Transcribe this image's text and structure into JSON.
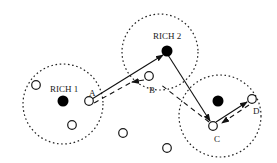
{
  "diagram": {
    "rich_nodes": [
      {
        "id": "rich1",
        "label": "RICH 1"
      },
      {
        "id": "rich2",
        "label": "RICH 2"
      },
      {
        "id": "rich3",
        "label": ""
      }
    ],
    "path_nodes": [
      {
        "id": "A",
        "label": "A"
      },
      {
        "id": "B",
        "label": "B"
      },
      {
        "id": "C",
        "label": "C"
      },
      {
        "id": "D",
        "label": "D"
      }
    ],
    "edges": [
      {
        "from": "A",
        "to": "rich2",
        "style": "solid"
      },
      {
        "from": "rich2",
        "to": "C",
        "style": "solid"
      },
      {
        "from": "C",
        "to": "D",
        "style": "solid"
      },
      {
        "from": "B",
        "to": "A",
        "style": "dashed"
      },
      {
        "from": "C",
        "to": "B",
        "style": "dashed"
      },
      {
        "from": "D",
        "to": "C",
        "style": "dashed"
      }
    ]
  }
}
